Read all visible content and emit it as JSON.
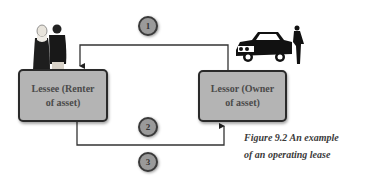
{
  "figure": {
    "caption_line1": "Figure 9.2 An example",
    "caption_line2": "of an operating lease"
  },
  "nodes": {
    "lessee": {
      "line1": "Lessee (Renter",
      "line2": "of asset)"
    },
    "lessor": {
      "line1": "Lessor (Owner",
      "line2": "of asset)"
    }
  },
  "steps": [
    {
      "label": "1"
    },
    {
      "label": "2"
    },
    {
      "label": "3"
    }
  ],
  "illustrations": {
    "lessee": "people-icon",
    "lessor": "car-with-driver-icon"
  },
  "colors": {
    "box_fill": "#b4b4b4",
    "box_border": "#2a2a2a",
    "circle_fill": "#9a9a9a",
    "line": "#333333"
  }
}
